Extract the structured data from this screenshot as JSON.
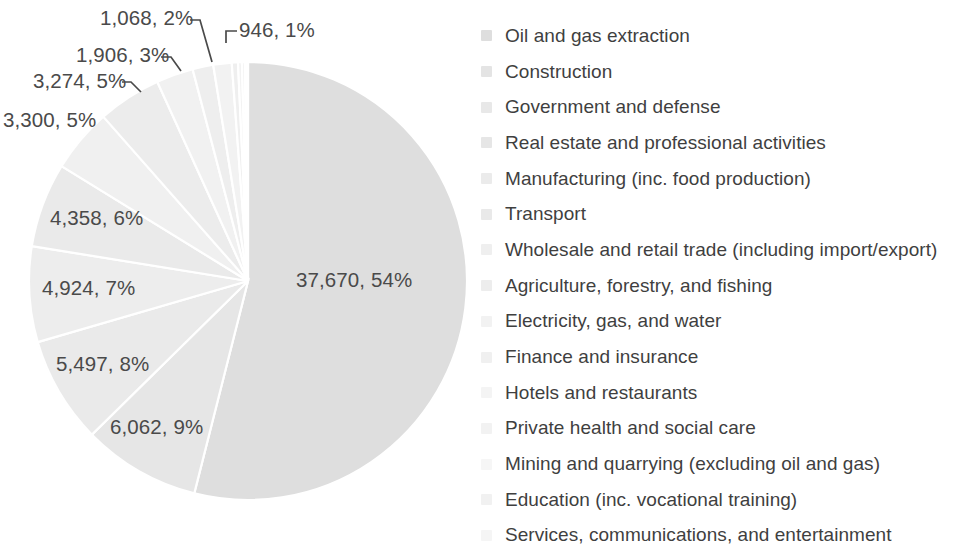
{
  "chart_data": {
    "type": "pie",
    "title": "",
    "subtitle": "",
    "xlabel": "",
    "ylabel": "",
    "legend_position": "right",
    "grid": false,
    "label_format": "value, percent",
    "total": 69833,
    "categories": [
      "Oil and gas extraction",
      "Construction",
      "Government and defense",
      "Real estate and professional activities",
      "Manufacturing (inc. food production)",
      "Transport",
      "Wholesale and retail trade (including import/export)",
      "Agriculture, forestry, and fishing",
      "Electricity, gas, and water",
      "Finance and insurance",
      "Hotels and restaurants",
      "Private health and social care",
      "Mining and quarrying (excluding oil and gas)",
      "Education (inc. vocational training)",
      "Services, communications, and entertainment"
    ],
    "values": [
      37670,
      6062,
      5497,
      4924,
      4358,
      3300,
      3274,
      1906,
      1068,
      946,
      320,
      200,
      150,
      100,
      58
    ],
    "percents": [
      54,
      9,
      8,
      7,
      6,
      5,
      5,
      3,
      2,
      1,
      0,
      0,
      0,
      0,
      0
    ],
    "slice_colors": [
      "#dedede",
      "#e6e6e6",
      "#eaeaea",
      "#ededed",
      "#eaeaea",
      "#f0f0f0",
      "#ececec",
      "#f1f1f1",
      "#eeeeee",
      "#f2f2f2",
      "#efefef",
      "#f3f3f3",
      "#f0f0f0",
      "#f4f4f4",
      "#f1f1f1"
    ],
    "visible_labels": [
      {
        "text": "37,670, 54%",
        "value": 37670,
        "percent": 54
      },
      {
        "text": "6,062, 9%",
        "value": 6062,
        "percent": 9
      },
      {
        "text": "5,497, 8%",
        "value": 5497,
        "percent": 8
      },
      {
        "text": "4,924, 7%",
        "value": 4924,
        "percent": 7
      },
      {
        "text": "4,358, 6%",
        "value": 4358,
        "percent": 6
      },
      {
        "text": "3,300, 5%",
        "value": 3300,
        "percent": 5
      },
      {
        "text": "3,274, 5%",
        "value": 3274,
        "percent": 5
      },
      {
        "text": "1,906, 3%",
        "value": 1906,
        "percent": 3
      },
      {
        "text": "1,068, 2%",
        "value": 1068,
        "percent": 2
      },
      {
        "text": "946, 1%",
        "value": 946,
        "percent": 1
      }
    ]
  },
  "labels": {
    "l_1068": "1,068, 2%",
    "l_946": "946, 1%",
    "l_1906": "1,906, 3%",
    "l_3274": "3,274, 5%",
    "l_3300": "3,300, 5%",
    "l_4358": "4,358, 6%",
    "l_4924": "4,924, 7%",
    "l_5497": "5,497, 8%",
    "l_6062": "6,062, 9%",
    "l_37670": "37,670, 54%"
  },
  "legend": {
    "items": [
      {
        "label": "Oil and gas extraction",
        "color": "#dedede"
      },
      {
        "label": "Construction",
        "color": "#e4e4e4"
      },
      {
        "label": "Government and defense",
        "color": "#e8e8e8"
      },
      {
        "label": "Real estate and professional activities",
        "color": "#e6e6e6"
      },
      {
        "label": "Manufacturing (inc. food production)",
        "color": "#ebebeb"
      },
      {
        "label": "Transport",
        "color": "#e9e9e9"
      },
      {
        "label": "Wholesale and retail trade (including import/export)",
        "color": "#efefef"
      },
      {
        "label": "Agriculture, forestry, and fishing",
        "color": "#ededed"
      },
      {
        "label": "Electricity, gas, and water",
        "color": "#f2f2f2"
      },
      {
        "label": "Finance and insurance",
        "color": "#f0f0f0"
      },
      {
        "label": "Hotels and restaurants",
        "color": "#f4f4f4"
      },
      {
        "label": "Private health and social care",
        "color": "#f2f2f2"
      },
      {
        "label": "Mining and quarrying (excluding oil and gas)",
        "color": "#f6f6f6"
      },
      {
        "label": "Education (inc. vocational training)",
        "color": "#f1f1f1"
      },
      {
        "label": "Services, communications, and entertainment",
        "color": "#f5f5f5"
      }
    ]
  },
  "colors": {
    "background": "#ffffff",
    "text": "#3f3f3f",
    "datalabel_text": "#4a4a4a",
    "leader_line": "#4a4a4a",
    "slice_divider": "#ffffff",
    "largest_slice": "#dedede"
  }
}
